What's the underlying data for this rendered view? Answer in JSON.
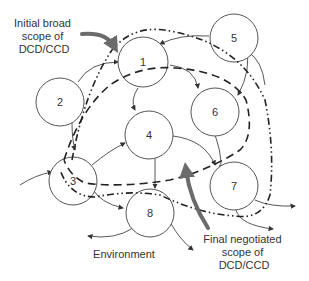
{
  "diagram": {
    "nodes": [
      {
        "id": "1",
        "label": "1"
      },
      {
        "id": "2",
        "label": "2"
      },
      {
        "id": "3",
        "label": "3"
      },
      {
        "id": "4",
        "label": "4"
      },
      {
        "id": "5",
        "label": "5"
      },
      {
        "id": "6",
        "label": "6"
      },
      {
        "id": "7",
        "label": "7"
      },
      {
        "id": "8",
        "label": "8"
      }
    ],
    "annotations": {
      "initial_scope": [
        "Initial broad",
        "scope of",
        "DCD/CCD"
      ],
      "final_scope": [
        "Final negotiated",
        "scope of",
        "DCD/CCD"
      ],
      "environment": "Environment"
    },
    "legend": {
      "initial_scope_line": "dash-dot-dot",
      "final_scope_line": "dashed"
    },
    "colors": {
      "node_stroke": "#555555",
      "scope_line": "#222222",
      "callout_arrow": "#6b6b6b",
      "text": "#333333"
    }
  }
}
